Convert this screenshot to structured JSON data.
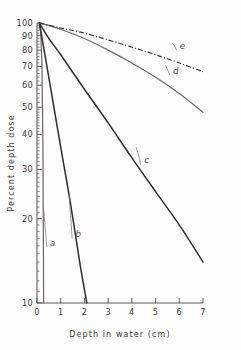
{
  "chart_data": {
    "type": "line",
    "title": "",
    "subtitle": "",
    "xlabel": "Depth in water (cm)",
    "ylabel": "Percent depth dose",
    "xlim": [
      0,
      7
    ],
    "ylim": [
      10,
      100
    ],
    "yscale": "log",
    "xscale": "linear",
    "grid": false,
    "legend": "inline-annotations",
    "xticks": [
      0,
      1,
      2,
      3,
      4,
      5,
      6,
      7
    ],
    "xticklabels": [
      "0",
      "1",
      "2",
      "3",
      "4",
      "5",
      "6",
      "7"
    ],
    "yticks": [
      10,
      20,
      30,
      40,
      50,
      60,
      70,
      80,
      90,
      100
    ],
    "yticklabels": [
      "10",
      "20",
      "30",
      "40",
      "50",
      "60",
      "70",
      "80",
      "90",
      "100"
    ],
    "annotations": [
      {
        "text": "a",
        "x": 0.55,
        "y": 16.0
      },
      {
        "text": "b",
        "x": 1.62,
        "y": 17.2
      },
      {
        "text": "c",
        "x": 4.52,
        "y": 31.5
      },
      {
        "text": "d",
        "x": 5.73,
        "y": 66.0
      },
      {
        "text": "e",
        "x": 6.02,
        "y": 81.0
      }
    ],
    "series": [
      {
        "name": "a",
        "style": "solid-thin",
        "x": [
          0.1,
          0.16,
          0.21,
          0.25,
          0.27,
          0.28
        ],
        "y": [
          100,
          92,
          70,
          36,
          16,
          10
        ]
      },
      {
        "name": "b",
        "style": "solid",
        "x": [
          0.1,
          0.3,
          0.6,
          1.0,
          1.4,
          1.8,
          2.1
        ],
        "y": [
          100,
          80,
          57,
          36,
          23,
          14,
          10
        ]
      },
      {
        "name": "c",
        "style": "solid",
        "x": [
          0.1,
          0.5,
          1.0,
          2.0,
          3.0,
          4.0,
          5.0,
          6.0,
          7.0
        ],
        "y": [
          100,
          88,
          77,
          58,
          44,
          33,
          25,
          19,
          14
        ]
      },
      {
        "name": "d",
        "style": "solid-thin",
        "x": [
          0.1,
          0.5,
          1.0,
          2.0,
          3.0,
          4.0,
          5.0,
          6.0,
          7.0
        ],
        "y": [
          100,
          98,
          95,
          88,
          80,
          72,
          64,
          56,
          48
        ]
      },
      {
        "name": "e",
        "style": "dash-dot",
        "x": [
          0.1,
          1.0,
          2.0,
          3.0,
          4.0,
          5.0,
          6.0,
          7.0
        ],
        "y": [
          100,
          96,
          92,
          87,
          82,
          77,
          72,
          67
        ]
      }
    ]
  },
  "axes": {
    "x_title": "Depth in water (cm)",
    "y_title": "Percent depth dose"
  }
}
